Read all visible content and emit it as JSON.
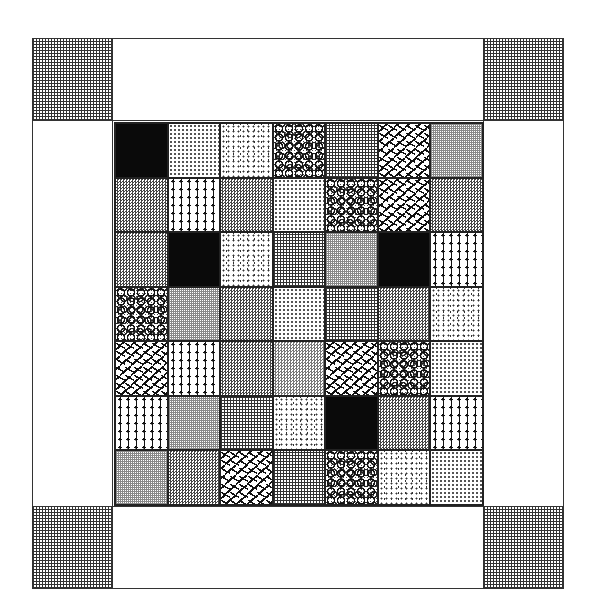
{
  "figure": {
    "type": "quilt-pattern-diagram",
    "frame": {
      "corners": [
        "grid-pattern",
        "grid-pattern",
        "grid-pattern",
        "grid-pattern"
      ],
      "border_strips": "white"
    },
    "grid": {
      "rows": 7,
      "cols": 7,
      "patches": [
        [
          "black",
          "dots",
          "stipple",
          "bubbles",
          "grid",
          "confetti",
          "finegrid"
        ],
        [
          "check",
          "palms",
          "check",
          "dots",
          "bubbles",
          "confetti",
          "check"
        ],
        [
          "check",
          "black",
          "stipple",
          "grid",
          "finegrid",
          "black",
          "palms"
        ],
        [
          "bubbles",
          "finegrid",
          "check",
          "dots",
          "grid",
          "check",
          "stipple"
        ],
        [
          "confetti",
          "palms",
          "check",
          "check2",
          "confetti",
          "bubbles",
          "dots"
        ],
        [
          "palms",
          "finegrid",
          "grid",
          "stipple",
          "black",
          "check",
          "palms"
        ],
        [
          "finegrid",
          "check",
          "confetti",
          "grid",
          "bubbles",
          "stipple",
          "dots"
        ]
      ]
    }
  }
}
